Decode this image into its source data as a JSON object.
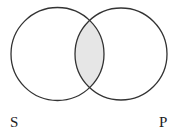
{
  "diagram": {
    "type": "venn",
    "sets": [
      {
        "label": "S",
        "cx": 57.5,
        "cy": 54,
        "r": 46.5
      },
      {
        "label": "P",
        "cx": 121,
        "cy": 54,
        "r": 46
      }
    ],
    "shaded_region": "intersection",
    "colors": {
      "stroke": "#333333",
      "shade": "#e6e6e6",
      "background": "#ffffff"
    }
  },
  "labels": {
    "left": "S",
    "right": "P"
  }
}
